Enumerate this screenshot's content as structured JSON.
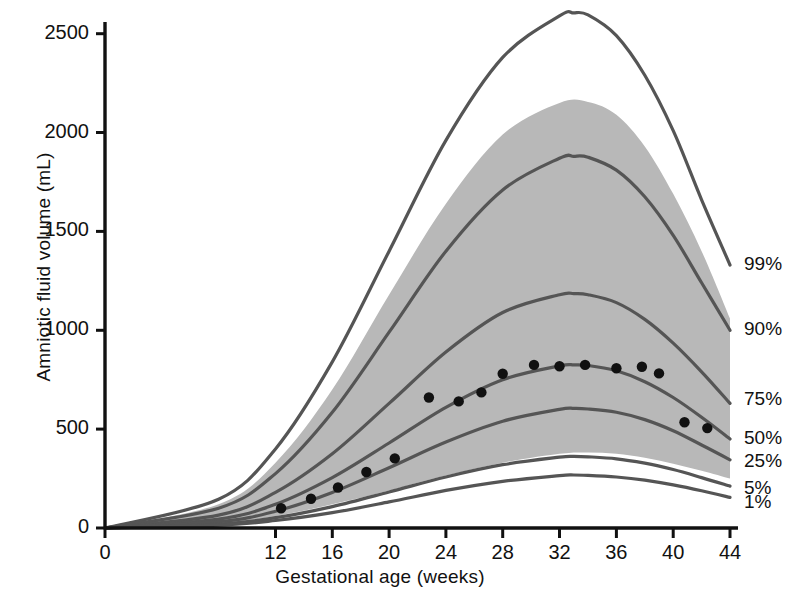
{
  "chart_data": {
    "type": "line",
    "title": "",
    "xlabel": "Gestational age (weeks)",
    "ylabel": "Amniotic fluid volume (mL)",
    "xlim": [
      0,
      44
    ],
    "ylim": [
      0,
      2650
    ],
    "xticks": [
      0,
      12,
      16,
      20,
      24,
      28,
      32,
      36,
      40,
      44
    ],
    "xtick_labels": [
      "0",
      "12",
      "16",
      "20",
      "24",
      "28",
      "32",
      "36",
      "40",
      "44"
    ],
    "yticks": [
      0,
      500,
      1000,
      1500,
      2000,
      2500
    ],
    "ytick_labels": [
      "0",
      "500",
      "1000",
      "1500",
      "2000",
      "2500"
    ],
    "grid": false,
    "legend_position": "right-outside",
    "shaded_band": {
      "label": "reference range band",
      "color": "#b8b8b8",
      "upper_name": "97th-percentile-ish upper band edge",
      "lower_name": "10th-percentile-ish lower band edge",
      "upper": [
        [
          0,
          0
        ],
        [
          8,
          120
        ],
        [
          12,
          330
        ],
        [
          16,
          700
        ],
        [
          20,
          1180
        ],
        [
          24,
          1640
        ],
        [
          28,
          1990
        ],
        [
          32,
          2150
        ],
        [
          34,
          2155
        ],
        [
          36,
          2090
        ],
        [
          38,
          1930
        ],
        [
          40,
          1690
        ],
        [
          42,
          1400
        ],
        [
          44,
          1060
        ]
      ],
      "lower": [
        [
          0,
          0
        ],
        [
          8,
          25
        ],
        [
          12,
          60
        ],
        [
          16,
          120
        ],
        [
          20,
          190
        ],
        [
          24,
          265
        ],
        [
          28,
          330
        ],
        [
          32,
          375
        ],
        [
          34,
          382
        ],
        [
          36,
          375
        ],
        [
          38,
          355
        ],
        [
          40,
          325
        ],
        [
          42,
          290
        ],
        [
          44,
          250
        ]
      ]
    },
    "series": [
      {
        "name": "99%",
        "label": "99%",
        "color": "#555555",
        "points": [
          [
            0,
            0
          ],
          [
            8,
            145
          ],
          [
            12,
            400
          ],
          [
            16,
            840
          ],
          [
            20,
            1400
          ],
          [
            24,
            1960
          ],
          [
            28,
            2380
          ],
          [
            32,
            2590
          ],
          [
            33,
            2605
          ],
          [
            34,
            2595
          ],
          [
            36,
            2490
          ],
          [
            38,
            2290
          ],
          [
            40,
            2010
          ],
          [
            42,
            1660
          ],
          [
            44,
            1330
          ]
        ]
      },
      {
        "name": "90%",
        "label": "90%",
        "color": "#555555",
        "points": [
          [
            0,
            0
          ],
          [
            8,
            100
          ],
          [
            12,
            275
          ],
          [
            16,
            585
          ],
          [
            20,
            990
          ],
          [
            24,
            1400
          ],
          [
            28,
            1710
          ],
          [
            32,
            1870
          ],
          [
            33,
            1880
          ],
          [
            34,
            1875
          ],
          [
            36,
            1810
          ],
          [
            38,
            1675
          ],
          [
            40,
            1480
          ],
          [
            42,
            1240
          ],
          [
            44,
            1000
          ]
        ]
      },
      {
        "name": "75%",
        "label": "75%",
        "color": "#555555",
        "points": [
          [
            0,
            0
          ],
          [
            8,
            65
          ],
          [
            12,
            180
          ],
          [
            16,
            375
          ],
          [
            20,
            630
          ],
          [
            24,
            890
          ],
          [
            28,
            1090
          ],
          [
            32,
            1180
          ],
          [
            33,
            1185
          ],
          [
            34,
            1180
          ],
          [
            36,
            1140
          ],
          [
            38,
            1055
          ],
          [
            40,
            935
          ],
          [
            42,
            790
          ],
          [
            44,
            630
          ]
        ]
      },
      {
        "name": "50%",
        "label": "50%",
        "color": "#555555",
        "points": [
          [
            0,
            0
          ],
          [
            8,
            45
          ],
          [
            12,
            120
          ],
          [
            16,
            255
          ],
          [
            20,
            430
          ],
          [
            24,
            610
          ],
          [
            28,
            750
          ],
          [
            32,
            820
          ],
          [
            33,
            825
          ],
          [
            34,
            822
          ],
          [
            36,
            795
          ],
          [
            38,
            740
          ],
          [
            40,
            660
          ],
          [
            42,
            560
          ],
          [
            44,
            450
          ]
        ]
      },
      {
        "name": "25%",
        "label": "25%",
        "color": "#555555",
        "points": [
          [
            0,
            0
          ],
          [
            8,
            32
          ],
          [
            12,
            85
          ],
          [
            16,
            180
          ],
          [
            20,
            305
          ],
          [
            24,
            435
          ],
          [
            28,
            540
          ],
          [
            32,
            600
          ],
          [
            33,
            605
          ],
          [
            34,
            602
          ],
          [
            36,
            585
          ],
          [
            38,
            548
          ],
          [
            40,
            492
          ],
          [
            42,
            420
          ],
          [
            44,
            345
          ]
        ]
      },
      {
        "name": "5%",
        "label": "5%",
        "color": "#555555",
        "points": [
          [
            0,
            0
          ],
          [
            8,
            20
          ],
          [
            12,
            52
          ],
          [
            16,
            108
          ],
          [
            20,
            182
          ],
          [
            24,
            258
          ],
          [
            28,
            320
          ],
          [
            32,
            358
          ],
          [
            33,
            362
          ],
          [
            34,
            360
          ],
          [
            36,
            350
          ],
          [
            38,
            328
          ],
          [
            40,
            296
          ],
          [
            42,
            255
          ],
          [
            44,
            212
          ]
        ]
      },
      {
        "name": "1%",
        "label": "1%",
        "color": "#555555",
        "points": [
          [
            0,
            0
          ],
          [
            8,
            14
          ],
          [
            12,
            38
          ],
          [
            16,
            78
          ],
          [
            20,
            132
          ],
          [
            24,
            190
          ],
          [
            28,
            236
          ],
          [
            32,
            265
          ],
          [
            33,
            268
          ],
          [
            34,
            266
          ],
          [
            36,
            258
          ],
          [
            38,
            242
          ],
          [
            40,
            218
          ],
          [
            42,
            188
          ],
          [
            44,
            155
          ]
        ]
      }
    ],
    "scatter": {
      "name": "measured mean values",
      "marker": "filled-circle",
      "color": "#111111",
      "points": [
        [
          12.4,
          100
        ],
        [
          14.5,
          148
        ],
        [
          16.4,
          205
        ],
        [
          18.4,
          283
        ],
        [
          20.4,
          352
        ],
        [
          22.8,
          660
        ],
        [
          24.9,
          640
        ],
        [
          26.5,
          686
        ],
        [
          28.0,
          780
        ],
        [
          30.2,
          825
        ],
        [
          32.0,
          818
        ],
        [
          33.8,
          825
        ],
        [
          36.0,
          808
        ],
        [
          37.8,
          815
        ],
        [
          39.0,
          782
        ],
        [
          40.8,
          535
        ],
        [
          42.4,
          505
        ]
      ]
    }
  },
  "axis": {
    "y_title": "Amniotic fluid volume (mL)",
    "x_title": "Gestational age (weeks)"
  }
}
